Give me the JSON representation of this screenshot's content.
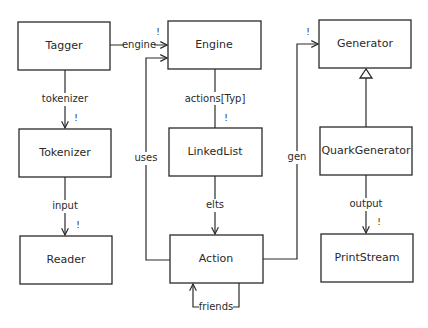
{
  "diagram": {
    "type": "uml-class-diagram",
    "classes": [
      {
        "id": "tagger",
        "label": "Tagger"
      },
      {
        "id": "engine",
        "label": "Engine"
      },
      {
        "id": "generator",
        "label": "Generator"
      },
      {
        "id": "tokenizer",
        "label": "Tokenizer"
      },
      {
        "id": "linkedlist",
        "label": "LinkedList"
      },
      {
        "id": "quarkgenerator",
        "label": "QuarkGenerator"
      },
      {
        "id": "reader",
        "label": "Reader"
      },
      {
        "id": "action",
        "label": "Action"
      },
      {
        "id": "printstream",
        "label": "PrintStream"
      }
    ],
    "relations": [
      {
        "from": "Tagger",
        "to": "Engine",
        "label": "engine",
        "multiplicity": "!",
        "kind": "association"
      },
      {
        "from": "Tagger",
        "to": "Tokenizer",
        "label": "tokenizer",
        "multiplicity": "!",
        "kind": "association"
      },
      {
        "from": "Tokenizer",
        "to": "Reader",
        "label": "input",
        "multiplicity": "!",
        "kind": "association"
      },
      {
        "from": "Engine",
        "to": "LinkedList",
        "label": "actions[Typ]",
        "multiplicity": "!",
        "kind": "association"
      },
      {
        "from": "LinkedList",
        "to": "Action",
        "label": "elts",
        "multiplicity": "",
        "kind": "association"
      },
      {
        "from": "Action",
        "to": "Engine",
        "label": "uses",
        "multiplicity": "",
        "kind": "association"
      },
      {
        "from": "Action",
        "to": "Generator",
        "label": "gen",
        "multiplicity": "!",
        "kind": "association"
      },
      {
        "from": "Action",
        "to": "Action",
        "label": "friends",
        "multiplicity": "",
        "kind": "association"
      },
      {
        "from": "QuarkGenerator",
        "to": "Generator",
        "label": "",
        "multiplicity": "",
        "kind": "inheritance"
      },
      {
        "from": "QuarkGenerator",
        "to": "PrintStream",
        "label": "output",
        "multiplicity": "!",
        "kind": "association"
      }
    ]
  }
}
